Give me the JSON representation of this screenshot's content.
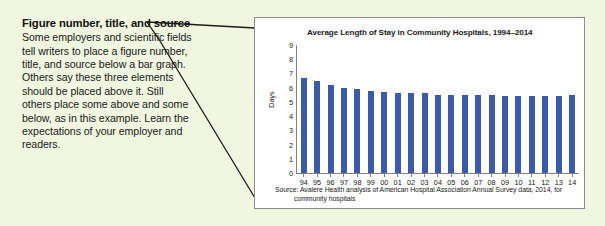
{
  "annotation": {
    "heading": "Figure number, title, and source",
    "body": "Some employers and scientific fields tell writers to place a figure number, title, and source below a bar graph. Others say these three elements should be placed above it. Still others place some above and some below, as in this example. Learn the expectations of your employer and readers."
  },
  "colors": {
    "page_background": "#f1f6e0",
    "panel_background": "#ffffff",
    "panel_border": "#8d8d8d",
    "bar": "#3b5ba8",
    "axis": "#808080",
    "text": "#1a1a1a",
    "leader_line": "#1c1c1c"
  },
  "source": {
    "line1": "Source: Avalere Health analysis of American Hospital Association Annual Survey data, 2014, for",
    "line2": "community hospitals"
  },
  "chart_data": {
    "type": "bar",
    "title": "Average Length of Stay in Community Hospitals, 1994–2014",
    "xlabel": "",
    "ylabel": "Days",
    "ylim": [
      0,
      9
    ],
    "yticks": [
      9,
      8,
      7,
      6,
      5,
      4,
      3,
      2,
      1,
      0
    ],
    "grid": false,
    "legend": false,
    "categories": [
      "94",
      "95",
      "96",
      "97",
      "98",
      "99",
      "00",
      "01",
      "02",
      "03",
      "04",
      "05",
      "06",
      "07",
      "08",
      "09",
      "10",
      "11",
      "12",
      "13",
      "14"
    ],
    "values": [
      6.7,
      6.5,
      6.2,
      6.0,
      5.9,
      5.8,
      5.7,
      5.6,
      5.6,
      5.6,
      5.5,
      5.5,
      5.5,
      5.5,
      5.5,
      5.4,
      5.4,
      5.4,
      5.4,
      5.4,
      5.5
    ]
  }
}
